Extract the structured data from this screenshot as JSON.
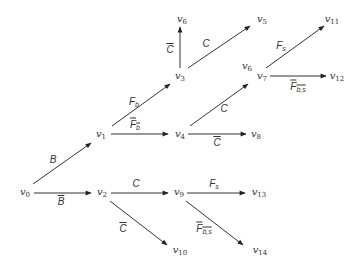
{
  "diagram": {
    "type": "decision-tree",
    "nodes": [
      {
        "id": "v0",
        "base": "v",
        "sub": "0",
        "x": 25,
        "y": 193
      },
      {
        "id": "v1",
        "base": "v",
        "sub": "1",
        "x": 101,
        "y": 135
      },
      {
        "id": "v2",
        "base": "v",
        "sub": "2",
        "x": 102,
        "y": 193
      },
      {
        "id": "v3",
        "base": "v",
        "sub": "3",
        "x": 180,
        "y": 77
      },
      {
        "id": "v4",
        "base": "v",
        "sub": "4",
        "x": 180,
        "y": 135
      },
      {
        "id": "v5",
        "base": "v",
        "sub": "5",
        "x": 262,
        "y": 20
      },
      {
        "id": "v6a",
        "base": "v",
        "sub": "6",
        "x": 182,
        "y": 20
      },
      {
        "id": "v6b",
        "base": "v",
        "sub": "6",
        "x": 247,
        "y": 67
      },
      {
        "id": "v7",
        "base": "v",
        "sub": "7",
        "x": 262,
        "y": 77
      },
      {
        "id": "v8",
        "base": "v",
        "sub": "8",
        "x": 256,
        "y": 135
      },
      {
        "id": "v9",
        "base": "v",
        "sub": "9",
        "x": 179,
        "y": 193
      },
      {
        "id": "v10",
        "base": "v",
        "sub": "10",
        "x": 180,
        "y": 251
      },
      {
        "id": "v11",
        "base": "v",
        "sub": "11",
        "x": 332,
        "y": 20
      },
      {
        "id": "v12",
        "base": "v",
        "sub": "12",
        "x": 337,
        "y": 77
      },
      {
        "id": "v13",
        "base": "v",
        "sub": "13",
        "x": 259,
        "y": 193
      },
      {
        "id": "v14",
        "base": "v",
        "sub": "14",
        "x": 260,
        "y": 251
      }
    ],
    "edges": [
      {
        "from": "v0",
        "to": "v1",
        "x1": 33,
        "y1": 184,
        "x2": 91,
        "y2": 143,
        "label": "B",
        "sub": "",
        "bar": false,
        "lx": 53,
        "ly": 160
      },
      {
        "from": "v0",
        "to": "v2",
        "x1": 34,
        "y1": 193,
        "x2": 91,
        "y2": 193,
        "label": "B",
        "sub": "",
        "bar": true,
        "lx": 61,
        "ly": 202
      },
      {
        "from": "v1",
        "to": "v3",
        "x1": 112,
        "y1": 126,
        "x2": 170,
        "y2": 84,
        "label": "F",
        "sub": "b",
        "bar": false,
        "lx": 134,
        "ly": 102
      },
      {
        "from": "v1",
        "to": "v4",
        "x1": 111,
        "y1": 134,
        "x2": 168,
        "y2": 134,
        "label": "F",
        "sub": "b",
        "bar": true,
        "lx": 135,
        "ly": 125
      },
      {
        "from": "v3",
        "to": "v6a",
        "x1": 180,
        "y1": 68,
        "x2": 180,
        "y2": 27,
        "label": "C",
        "sub": "",
        "bar": true,
        "lx": 170,
        "ly": 50
      },
      {
        "from": "v3",
        "to": "v5",
        "x1": 188,
        "y1": 68,
        "x2": 250,
        "y2": 26,
        "label": "C",
        "sub": "",
        "bar": false,
        "lx": 206,
        "ly": 44
      },
      {
        "from": "v4",
        "to": "v6b",
        "x1": 190,
        "y1": 126,
        "x2": 248,
        "y2": 84,
        "label": "C",
        "sub": "",
        "bar": false,
        "lx": 224,
        "ly": 109
      },
      {
        "from": "v4",
        "to": "v8",
        "x1": 188,
        "y1": 134,
        "x2": 246,
        "y2": 134,
        "label": "C",
        "sub": "",
        "bar": true,
        "lx": 217,
        "ly": 143
      },
      {
        "from": "v7",
        "to": "v11",
        "x1": 266,
        "y1": 68,
        "x2": 324,
        "y2": 26,
        "label": "F",
        "sub": "s",
        "bar": false,
        "lx": 281,
        "ly": 46
      },
      {
        "from": "v7",
        "to": "v12",
        "x1": 270,
        "y1": 76,
        "x2": 326,
        "y2": 76,
        "label": "F",
        "sub": "b,s",
        "bar": true,
        "lx": 298,
        "ly": 87
      },
      {
        "from": "v2",
        "to": "v9",
        "x1": 111,
        "y1": 193,
        "x2": 168,
        "y2": 193,
        "label": "C",
        "sub": "",
        "bar": false,
        "lx": 136,
        "ly": 184
      },
      {
        "from": "v2",
        "to": "v10",
        "x1": 110,
        "y1": 201,
        "x2": 167,
        "y2": 245,
        "label": "C",
        "sub": "",
        "bar": true,
        "lx": 123,
        "ly": 229
      },
      {
        "from": "v9",
        "to": "v13",
        "x1": 187,
        "y1": 193,
        "x2": 245,
        "y2": 193,
        "label": "F",
        "sub": "s",
        "bar": false,
        "lx": 214,
        "ly": 184
      },
      {
        "from": "v9",
        "to": "v14",
        "x1": 186,
        "y1": 201,
        "x2": 243,
        "y2": 245,
        "label": "F",
        "sub": "b,s",
        "bar": true,
        "lx": 204,
        "ly": 229
      }
    ],
    "colors": {
      "stroke": "#333333",
      "text": "#333333",
      "background": "#ffffff"
    }
  }
}
